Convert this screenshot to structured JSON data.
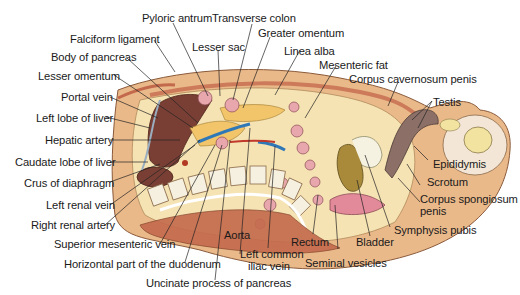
{
  "figure": {
    "colors": {
      "liver": "#7a3f34",
      "fat": "#f3d9a0",
      "body_wall": "#eab98a",
      "muscle": "#c46a4c",
      "vein_blue": "#2f78b8",
      "bone": "#f5f0e0",
      "bowel_loop": "#e8a7ad",
      "penis_shaft": "#8c7068",
      "prostate_bladder": "#a88a3a"
    }
  },
  "labels": {
    "pyloric_antrum": "Pyloric antrum",
    "transverse_colon": "Transverse colon",
    "falciform_ligament": "Falciform ligament",
    "lesser_sac": "Lesser sac",
    "greater_omentum": "Greater omentum",
    "body_of_pancreas": "Body of pancreas",
    "linea_alba": "Linea alba",
    "lesser_omentum": "Lesser omentum",
    "mesenteric_fat": "Mesenteric fat",
    "corpus_cavernosum_penis": "Corpus cavernosum penis",
    "portal_vein": "Portal vein",
    "testis": "Testis",
    "left_lobe_of_liver": "Left lobe of liver",
    "hepatic_artery": "Hepatic artery",
    "caudate_lobe_of_liver": "Caudate lobe of liver",
    "crus_of_diaphragm": "Crus of diaphragm",
    "epididymis": "Epididymis",
    "left_renal_vein": "Left renal vein",
    "scrotum": "Scrotum",
    "corpus_spongiosum_penis_1": "Corpus spongiosum",
    "corpus_spongiosum_penis_2": "penis",
    "right_renal_artery": "Right renal artery",
    "symphysis_pubis": "Symphysis pubis",
    "superior_mesenteric_vein": "Superior mesenteric vein",
    "aorta": "Aorta",
    "rectum": "Rectum",
    "bladder": "Bladder",
    "horizontal_duodenum": "Horizontal part of the duodenum",
    "left_common_iliac_vein_1": "Left common",
    "left_common_iliac_vein_2": "iliac vein",
    "seminal_vesicles": "Seminal vesicles",
    "uncinate_process": "Uncinate process of pancreas"
  }
}
